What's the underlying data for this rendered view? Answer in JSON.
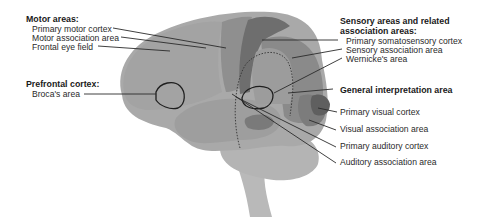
{
  "diagram": {
    "type": "labeled anatomical illustration",
    "colors": {
      "background": "#ffffff",
      "brain_base": "#a9a9a9",
      "frontal_lobe": "#a3a3a3",
      "motor_strip": "#8f8f8f",
      "somatosensory_strip": "#6e6e6e",
      "sensory_association": "#8a8a8a",
      "general_interpretation": "#9c9c9c",
      "primary_visual": "#5f5f5f",
      "visual_association": "#7c7c7c",
      "primary_auditory": "#7a7a7a",
      "cerebellum": "#b4b4b4",
      "brainstem": "#b9b9b9",
      "outline": "#222222",
      "leader_line": "#2a2a2a"
    }
  },
  "groups": {
    "motor": {
      "heading": "Motor areas:",
      "items": [
        "Primary motor cortex",
        "Motor association area",
        "Frontal eye field"
      ]
    },
    "prefrontal": {
      "heading": "Prefrontal cortex:",
      "items": [
        "Broca's area"
      ]
    },
    "sensory": {
      "heading_line1": "Sensory areas and related",
      "heading_line2": "association areas:",
      "items": [
        "Primary somatosensory cortex",
        "Sensory association area",
        "Wernicke's area"
      ]
    },
    "general": {
      "heading": "General interpretation area"
    },
    "other_labels": [
      "Primary visual cortex",
      "Visual association area",
      "Primary auditory cortex",
      "Auditory association area"
    ]
  }
}
